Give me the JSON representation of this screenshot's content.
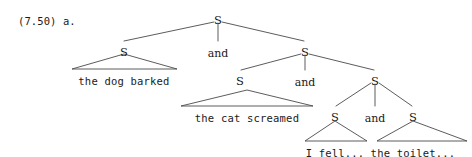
{
  "figure": {
    "example_label": "(7.50) a.",
    "type": "syntax-tree",
    "notation": "triangle-abbreviation",
    "line_color": "#4a4a4a",
    "text_color": "#1a1a1a",
    "background_color": "#ffffff"
  },
  "nodes": [
    {
      "id": "s-root",
      "label": "S",
      "x": 218,
      "y": 15,
      "kind": "node"
    },
    {
      "id": "s-l2-left",
      "label": "S",
      "x": 124,
      "y": 47,
      "kind": "node"
    },
    {
      "id": "and-l2",
      "label": "and",
      "x": 218,
      "y": 48,
      "kind": "conjunction"
    },
    {
      "id": "s-l2-right",
      "label": "S",
      "x": 305,
      "y": 47,
      "kind": "node"
    },
    {
      "id": "s-l3-left",
      "label": "S",
      "x": 240,
      "y": 76,
      "kind": "node"
    },
    {
      "id": "and-l3",
      "label": "and",
      "x": 305,
      "y": 77,
      "kind": "conjunction"
    },
    {
      "id": "s-l3-right",
      "label": "S",
      "x": 375,
      "y": 76,
      "kind": "node"
    },
    {
      "id": "s-l4-left",
      "label": "S",
      "x": 335,
      "y": 112,
      "kind": "node"
    },
    {
      "id": "and-l4",
      "label": "and",
      "x": 375,
      "y": 113,
      "kind": "conjunction"
    },
    {
      "id": "s-l4-right",
      "label": "S",
      "x": 413,
      "y": 112,
      "kind": "node"
    }
  ],
  "terminals": [
    {
      "id": "t-dog",
      "label": "the dog barked",
      "x": 124,
      "y": 76,
      "kind": "terminal"
    },
    {
      "id": "t-cat",
      "label": "the cat screamed",
      "x": 247,
      "y": 113,
      "kind": "terminal"
    },
    {
      "id": "t-fell",
      "label": "I fell...",
      "x": 335,
      "y": 148,
      "kind": "terminal"
    },
    {
      "id": "t-toilet",
      "label": "the toilet...",
      "x": 413,
      "y": 148,
      "kind": "terminal"
    }
  ],
  "branches": [
    {
      "from": "s-root",
      "to": "s-l2-left",
      "x1": 214,
      "y1": 22,
      "x2": 124,
      "y2": 41
    },
    {
      "from": "s-root",
      "to": "and-l2",
      "x1": 218,
      "y1": 23,
      "x2": 218,
      "y2": 41
    },
    {
      "from": "s-root",
      "to": "s-l2-right",
      "x1": 222,
      "y1": 22,
      "x2": 304,
      "y2": 41
    },
    {
      "from": "s-l2-right",
      "to": "s-l3-left",
      "x1": 301,
      "y1": 54,
      "x2": 241,
      "y2": 70
    },
    {
      "from": "s-l2-right",
      "to": "and-l3",
      "x1": 305,
      "y1": 55,
      "x2": 305,
      "y2": 70
    },
    {
      "from": "s-l2-right",
      "to": "s-l3-right",
      "x1": 309,
      "y1": 54,
      "x2": 374,
      "y2": 70
    },
    {
      "from": "s-l3-right",
      "to": "s-l4-left",
      "x1": 371,
      "y1": 83,
      "x2": 336,
      "y2": 106
    },
    {
      "from": "s-l3-right",
      "to": "and-l4",
      "x1": 375,
      "y1": 84,
      "x2": 375,
      "y2": 106
    },
    {
      "from": "s-l3-right",
      "to": "s-l4-right",
      "x1": 379,
      "y1": 83,
      "x2": 412,
      "y2": 106
    }
  ],
  "triangles": [
    {
      "id": "tri-dog",
      "for": "t-dog",
      "apex_x": 124,
      "apex_y": 54,
      "left_x": 72,
      "right_x": 177,
      "base_y": 69
    },
    {
      "id": "tri-cat",
      "for": "t-cat",
      "apex_x": 247,
      "apex_y": 90,
      "left_x": 181,
      "right_x": 313,
      "base_y": 106
    },
    {
      "id": "tri-fell",
      "for": "t-fell",
      "apex_x": 335,
      "apex_y": 121,
      "left_x": 305,
      "right_x": 367,
      "base_y": 141
    },
    {
      "id": "tri-toilet",
      "for": "t-toilet",
      "apex_x": 413,
      "apex_y": 121,
      "left_x": 377,
      "right_x": 467,
      "base_y": 141
    }
  ]
}
